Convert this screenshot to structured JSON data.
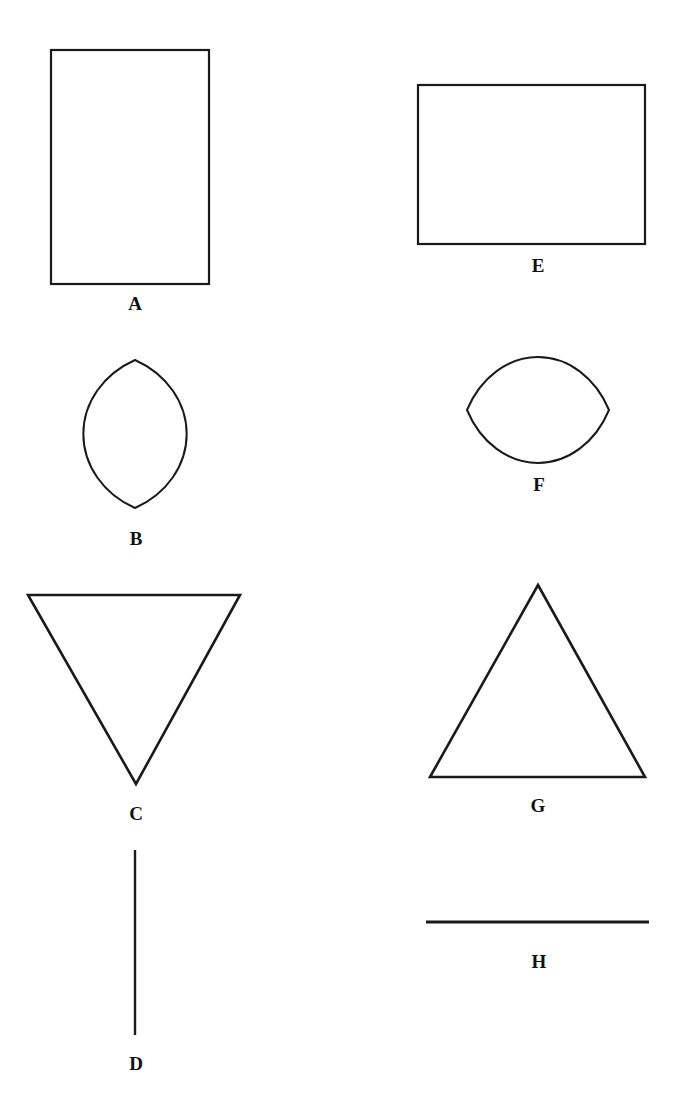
{
  "page": {
    "background_color": "#ffffff",
    "stroke_color": "#1a1a1a",
    "label_color": "#111111",
    "width": 681,
    "height": 1110
  },
  "figure": {
    "columns": [
      "left",
      "right"
    ],
    "shapes": [
      {
        "id": "A",
        "label": "A",
        "type": "rectangle",
        "orientation": "portrait",
        "column": "left",
        "x": 51,
        "y": 50,
        "width": 158,
        "height": 234,
        "stroke_width": 2.2,
        "label_x": 135,
        "label_y": 310
      },
      {
        "id": "E",
        "label": "E",
        "type": "rectangle",
        "orientation": "landscape",
        "column": "right",
        "x": 418,
        "y": 85,
        "width": 227,
        "height": 159,
        "stroke_width": 2.2,
        "label_x": 538,
        "label_y": 272
      },
      {
        "id": "B",
        "label": "B",
        "type": "lens",
        "orientation": "vertical",
        "column": "left",
        "center_x": 135,
        "center_y": 434,
        "half_width": 40,
        "half_height": 74,
        "stroke_width": 2.0,
        "label_x": 136,
        "label_y": 545
      },
      {
        "id": "F",
        "label": "F",
        "type": "lens",
        "orientation": "horizontal",
        "column": "right",
        "center_x": 538,
        "center_y": 410,
        "half_width": 71,
        "half_height": 41,
        "stroke_width": 2.0,
        "label_x": 539,
        "label_y": 491
      },
      {
        "id": "C",
        "label": "C",
        "type": "triangle",
        "orientation": "pointing-down",
        "column": "left",
        "points": "28,595 240,595 136,784",
        "stroke_width": 2.6,
        "label_x": 136,
        "label_y": 820
      },
      {
        "id": "G",
        "label": "G",
        "type": "triangle",
        "orientation": "pointing-up",
        "column": "right",
        "points": "538,585 645,777 430,777",
        "stroke_width": 2.6,
        "label_x": 538,
        "label_y": 812
      },
      {
        "id": "D",
        "label": "D",
        "type": "line",
        "orientation": "vertical",
        "column": "left",
        "x1": 135,
        "y1": 850,
        "x2": 135,
        "y2": 1035,
        "stroke_width": 2.4,
        "label_x": 136,
        "label_y": 1070
      },
      {
        "id": "H",
        "label": "H",
        "type": "line",
        "orientation": "horizontal",
        "column": "right",
        "x1": 426,
        "y1": 922,
        "x2": 649,
        "y2": 922,
        "stroke_width": 2.8,
        "label_x": 539,
        "label_y": 968
      }
    ]
  }
}
